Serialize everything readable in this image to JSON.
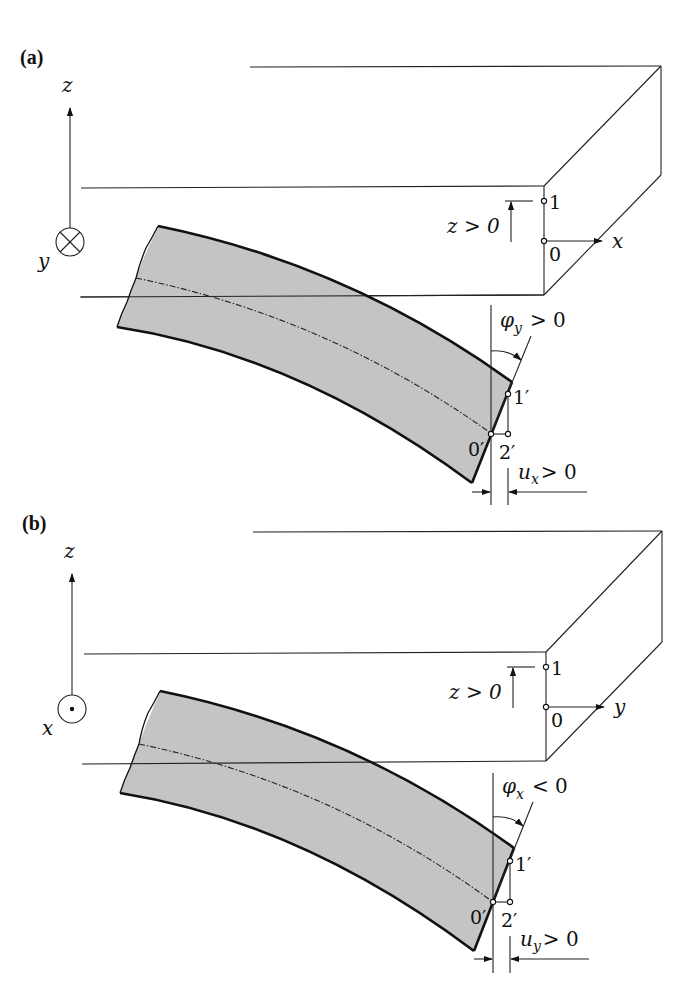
{
  "figure": {
    "panels": [
      {
        "id": "a",
        "label": "(a)",
        "axis_vertical": "z",
        "axis_out_of_plane": "y",
        "out_of_plane_symbol": "cross (into page)",
        "axis_horizontal": "x",
        "z_dim_label": "z > 0",
        "point_1": "1",
        "point_0": "0",
        "rotation_label": "φ",
        "rotation_sub": "y",
        "rotation_rel": "> 0",
        "point_1p": "1′",
        "point_0p": "0′",
        "point_2p": "2′",
        "disp_label": "u",
        "disp_sub": "x",
        "disp_rel": "> 0"
      },
      {
        "id": "b",
        "label": "(b)",
        "axis_vertical": "z",
        "axis_out_of_plane": "x",
        "out_of_plane_symbol": "dot (out of page)",
        "axis_horizontal": "y",
        "z_dim_label": "z > 0",
        "point_1": "1",
        "point_0": "0",
        "rotation_label": "φ",
        "rotation_sub": "x",
        "rotation_rel": "< 0",
        "point_1p": "1′",
        "point_0p": "0′",
        "point_2p": "2′",
        "disp_label": "u",
        "disp_sub": "y",
        "disp_rel": "> 0"
      }
    ],
    "colors": {
      "beam_fill": "#c4c4c4",
      "line": "#111111",
      "background": "#ffffff"
    }
  }
}
